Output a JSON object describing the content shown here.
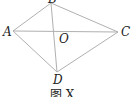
{
  "figure": {
    "points": {
      "A": {
        "label": "A",
        "x": 13,
        "y": 31
      },
      "B": {
        "label": "B",
        "x": 51,
        "y": 3
      },
      "C": {
        "label": "C",
        "x": 118,
        "y": 32
      },
      "D": {
        "label": "D",
        "x": 57,
        "y": 72
      },
      "O": {
        "label": "O",
        "x": 55,
        "y": 32
      }
    },
    "segments": [
      "AB",
      "BC",
      "CD",
      "DA",
      "AC",
      "BD"
    ],
    "caption": "图 X",
    "line_color": "#b0b0b0"
  }
}
